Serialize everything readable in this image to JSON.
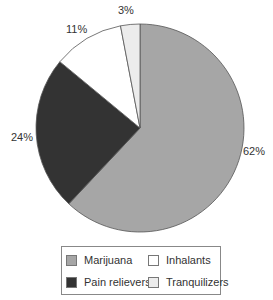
{
  "chart_data": {
    "type": "pie",
    "title": "",
    "categories": [
      "Marijuana",
      "Pain relievers",
      "Inhalants",
      "Tranquilizers"
    ],
    "values": [
      62,
      24,
      11,
      3
    ],
    "labels": [
      "62%",
      "24%",
      "11%",
      "3%"
    ],
    "colors": [
      "#a6a6a6",
      "#333333",
      "#ffffff",
      "#ececec"
    ],
    "legend_position": "bottom"
  },
  "legend": {
    "items": [
      {
        "label": "Marijuana",
        "color": "#a6a6a6"
      },
      {
        "label": "Inhalants",
        "color": "#ffffff"
      },
      {
        "label": "Pain relievers",
        "color": "#333333"
      },
      {
        "label": "Tranquilizers",
        "color": "#ececec"
      }
    ]
  }
}
